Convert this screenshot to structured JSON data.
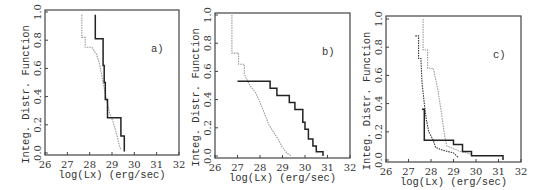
{
  "chart_data": [
    {
      "type": "line",
      "title": "",
      "panel_label": "a)",
      "xlabel": "log(Lx) (erg/sec)",
      "ylabel": "Integ. Distr. Function",
      "xlim": [
        26,
        32
      ],
      "ylim": [
        0,
        1
      ],
      "xticks": [
        "26",
        "27",
        "28",
        "29",
        "30",
        "31",
        "32"
      ],
      "yticks": [
        "0.0",
        "0.2",
        "0.4",
        "0.6",
        "0.8",
        "1.0"
      ],
      "grid": false,
      "legend": null,
      "step": true,
      "series": [
        {
          "name": "gray (dotted)",
          "color": "#9a9a9a",
          "points": [
            [
              27.65,
              0.98
            ],
            [
              27.65,
              0.82
            ],
            [
              27.8,
              0.82
            ],
            [
              27.8,
              0.75
            ],
            [
              28.1,
              0.75
            ],
            [
              28.3,
              0.7
            ],
            [
              28.45,
              0.63
            ],
            [
              28.6,
              0.5
            ],
            [
              28.75,
              0.38
            ],
            [
              28.9,
              0.28
            ],
            [
              29.05,
              0.22
            ],
            [
              29.2,
              0.14
            ],
            [
              29.3,
              0.07
            ],
            [
              29.4,
              0.02
            ]
          ]
        },
        {
          "name": "black (solid)",
          "color": "#222222",
          "points": [
            [
              28.25,
              0.98
            ],
            [
              28.25,
              0.81
            ],
            [
              28.6,
              0.81
            ],
            [
              28.6,
              0.62
            ],
            [
              28.65,
              0.62
            ],
            [
              28.65,
              0.5
            ],
            [
              28.7,
              0.5
            ],
            [
              28.7,
              0.38
            ],
            [
              28.8,
              0.38
            ],
            [
              28.8,
              0.25
            ],
            [
              29.4,
              0.25
            ],
            [
              29.4,
              0.12
            ],
            [
              29.55,
              0.12
            ],
            [
              29.55,
              0.01
            ]
          ]
        }
      ]
    },
    {
      "type": "line",
      "title": "",
      "panel_label": "b)",
      "xlabel": "log(Lx) (erg/sec)",
      "ylabel": "Integ. Distr. Function",
      "xlim": [
        26,
        32
      ],
      "ylim": [
        0,
        1
      ],
      "xticks": [
        "26",
        "27",
        "28",
        "29",
        "30",
        "31",
        "32"
      ],
      "yticks": [
        "0.0",
        "0.2",
        "0.4",
        "0.6",
        "0.8",
        "1.0"
      ],
      "grid": false,
      "legend": null,
      "step": true,
      "series": [
        {
          "name": "gray (dotted)",
          "color": "#9a9a9a",
          "points": [
            [
              26.75,
              1.0
            ],
            [
              26.75,
              0.73
            ],
            [
              27.05,
              0.73
            ],
            [
              27.05,
              0.65
            ],
            [
              27.3,
              0.65
            ],
            [
              27.3,
              0.58
            ],
            [
              27.55,
              0.5
            ],
            [
              27.8,
              0.45
            ],
            [
              28.0,
              0.38
            ],
            [
              28.2,
              0.3
            ],
            [
              28.4,
              0.22
            ],
            [
              28.6,
              0.17
            ],
            [
              28.8,
              0.12
            ],
            [
              29.0,
              0.06
            ],
            [
              29.2,
              0.02
            ],
            [
              29.4,
              0.0
            ]
          ]
        },
        {
          "name": "black (solid)",
          "color": "#222222",
          "points": [
            [
              27.0,
              0.53
            ],
            [
              28.45,
              0.53
            ],
            [
              28.45,
              0.48
            ],
            [
              28.75,
              0.48
            ],
            [
              28.75,
              0.43
            ],
            [
              29.3,
              0.43
            ],
            [
              29.3,
              0.38
            ],
            [
              29.55,
              0.38
            ],
            [
              29.55,
              0.33
            ],
            [
              29.9,
              0.33
            ],
            [
              29.9,
              0.24
            ],
            [
              30.0,
              0.24
            ],
            [
              30.0,
              0.19
            ],
            [
              30.15,
              0.19
            ],
            [
              30.15,
              0.12
            ],
            [
              30.35,
              0.12
            ],
            [
              30.35,
              0.07
            ],
            [
              30.5,
              0.07
            ],
            [
              30.5,
              0.03
            ],
            [
              30.8,
              0.03
            ],
            [
              30.8,
              0.0
            ]
          ]
        }
      ]
    },
    {
      "type": "line",
      "title": "",
      "panel_label": "c)",
      "xlabel": "log(Lx) (erg/sec)",
      "ylabel": "Integ. Distr. Function",
      "xlim": [
        26,
        32
      ],
      "ylim": [
        0,
        1
      ],
      "xticks": [
        "26",
        "27",
        "28",
        "29",
        "30",
        "31",
        "32"
      ],
      "yticks": [
        "0.0",
        "0.2",
        "0.4",
        "0.6",
        "0.8",
        "1.0"
      ],
      "grid": false,
      "legend": null,
      "step": true,
      "series": [
        {
          "name": "gray (dotted)",
          "color": "#9a9a9a",
          "points": [
            [
              27.65,
              1.0
            ],
            [
              27.65,
              0.78
            ],
            [
              27.85,
              0.78
            ],
            [
              27.85,
              0.65
            ],
            [
              28.1,
              0.65
            ],
            [
              28.3,
              0.5
            ],
            [
              28.45,
              0.35
            ],
            [
              28.6,
              0.18
            ],
            [
              28.7,
              0.1
            ],
            [
              29.0,
              0.08
            ],
            [
              29.3,
              0.06
            ],
            [
              29.6,
              0.05
            ],
            [
              29.8,
              0.04
            ]
          ]
        },
        {
          "name": "black (dotted, dark)",
          "color": "#333333",
          "points": [
            [
              27.3,
              0.88
            ],
            [
              27.45,
              0.88
            ],
            [
              27.45,
              0.72
            ],
            [
              27.55,
              0.72
            ],
            [
              27.6,
              0.55
            ],
            [
              27.7,
              0.4
            ],
            [
              27.8,
              0.28
            ],
            [
              27.9,
              0.2
            ],
            [
              28.1,
              0.14
            ],
            [
              28.2,
              0.09
            ],
            [
              28.5,
              0.07
            ],
            [
              29.0,
              0.05
            ],
            [
              29.2,
              0.02
            ]
          ]
        },
        {
          "name": "black (solid)",
          "color": "#222222",
          "points": [
            [
              27.6,
              0.36
            ],
            [
              27.6,
              0.36
            ],
            [
              27.7,
              0.36
            ],
            [
              27.7,
              0.14
            ],
            [
              29.0,
              0.14
            ],
            [
              29.0,
              0.11
            ],
            [
              29.4,
              0.11
            ],
            [
              29.4,
              0.06
            ],
            [
              29.8,
              0.06
            ],
            [
              29.8,
              0.03
            ],
            [
              31.2,
              0.03
            ],
            [
              31.2,
              0.0
            ]
          ]
        }
      ]
    }
  ],
  "panels": [
    {
      "label": "a)",
      "xlabel": "log(Lx) (erg/sec)",
      "ylabel": "Integ. Distr. Function"
    },
    {
      "label": "b)",
      "xlabel": "log(Lx) (erg/sec)",
      "ylabel": "Integ. Distr. Function"
    },
    {
      "label": "c)",
      "xlabel": "log(Lx) (erg/sec)",
      "ylabel": "Integ. Distr. Function"
    }
  ]
}
